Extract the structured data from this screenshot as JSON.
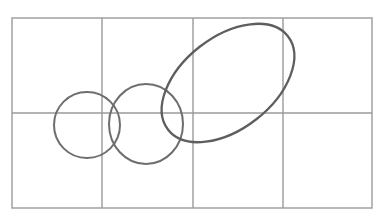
{
  "diagram": {
    "colors": {
      "background": "#ffffff",
      "grid": "#9a9a9a",
      "shapes": "#6e6e6e"
    },
    "grid": {
      "left": 12,
      "top": 18,
      "right": 372,
      "bottom": 208,
      "columns": 4,
      "rows": 2,
      "vertical_lines": [
        12,
        102,
        193,
        283,
        372
      ],
      "horizontal_lines": [
        18,
        113,
        208
      ]
    },
    "shapes": [
      {
        "type": "circle",
        "label": "left-circle",
        "cx": 87,
        "cy": 125,
        "r": 33
      },
      {
        "type": "circle",
        "label": "middle-circle",
        "cx": 146,
        "cy": 124,
        "rx": 37,
        "ry": 40
      },
      {
        "type": "ellipse",
        "label": "tilted-ellipse",
        "cx": 228,
        "cy": 83,
        "rx": 76,
        "ry": 46,
        "rotation": -38
      }
    ]
  }
}
